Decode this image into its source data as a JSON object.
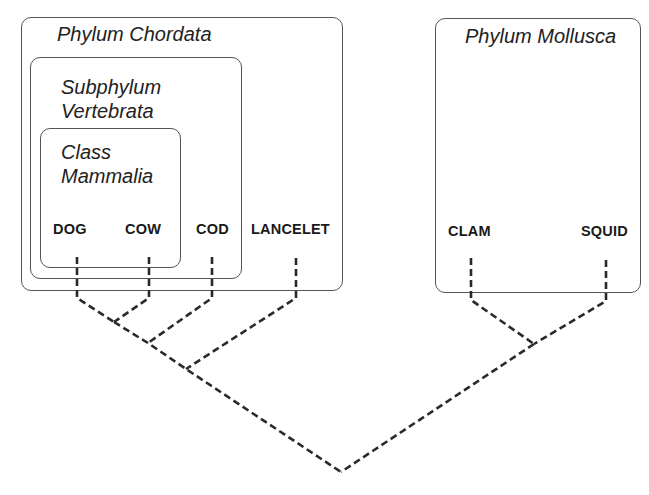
{
  "groups": {
    "chordata": {
      "label": "Phylum Chordata"
    },
    "vertebrata": {
      "label": "Subphylum\nVertebrata"
    },
    "mammalia": {
      "label": "Class\nMammalia"
    },
    "mollusca": {
      "label": "Phylum Mollusca"
    }
  },
  "taxa": {
    "dog": "DOG",
    "cow": "COW",
    "cod": "COD",
    "lancelet": "LANCELET",
    "clam": "CLAM",
    "squid": "SQUID"
  },
  "tree": {
    "line_style": "dashed",
    "line_color": "#2a2a2a",
    "nodes": {
      "dog_cow": [
        114,
        322
      ],
      "mammal_cod": [
        148,
        343
      ],
      "vert_lancelet": [
        186,
        369
      ],
      "clam_squid": [
        534,
        344
      ],
      "root": [
        341,
        472
      ]
    }
  }
}
